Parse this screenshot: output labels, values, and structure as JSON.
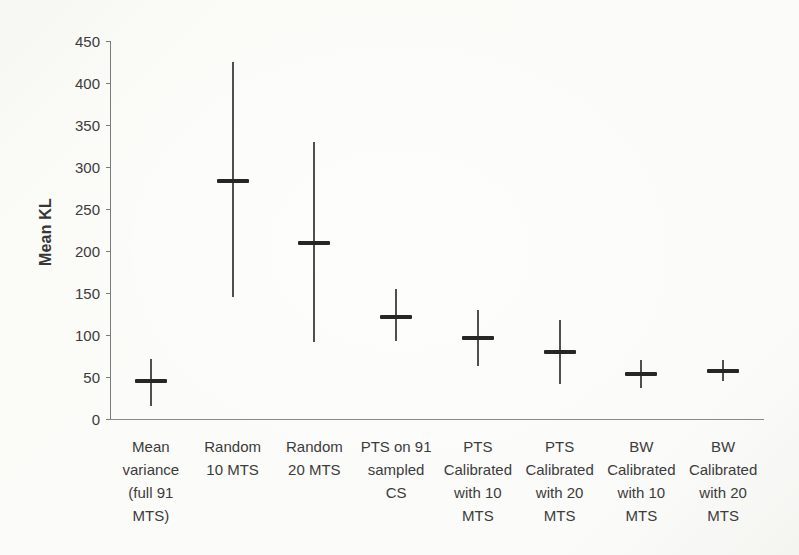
{
  "page": {
    "background": "#fafaf7"
  },
  "chart_data": {
    "type": "scatter",
    "subtype": "mean-with-error-bars",
    "title": "",
    "xlabel": "",
    "ylabel": "Mean KL",
    "ylim": [
      0,
      450
    ],
    "ytick_step": 50,
    "yticks": [
      450,
      400,
      350,
      300,
      250,
      200,
      150,
      100,
      50,
      0
    ],
    "grid": "off",
    "legend": "none",
    "categories": [
      "Mean variance (full 91 MTS)",
      "Random 10 MTS",
      "Random 20 MTS",
      "PTS on 91 sampled CS",
      "PTS Calibrated with 10 MTS",
      "PTS Calibrated with 20 MTS",
      "BW Calibrated with 10 MTS",
      "BW Calibrated with 20 MTS"
    ],
    "category_label_lines": [
      [
        "Mean",
        "variance",
        "(full 91",
        "MTS)"
      ],
      [
        "Random",
        "10 MTS"
      ],
      [
        "Random",
        "20 MTS"
      ],
      [
        "PTS on 91",
        "sampled",
        "CS"
      ],
      [
        "PTS",
        "Calibrated",
        "with 10",
        "MTS"
      ],
      [
        "PTS",
        "Calibrated",
        "with 20",
        "MTS"
      ],
      [
        "BW",
        "Calibrated",
        "with 10",
        "MTS"
      ],
      [
        "BW",
        "Calibrated",
        "with 20",
        "MTS"
      ]
    ],
    "series": [
      {
        "name": "Mean KL",
        "points": [
          {
            "mean": 45,
            "lo": 15,
            "hi": 72
          },
          {
            "mean": 283,
            "lo": 145,
            "hi": 425
          },
          {
            "mean": 210,
            "lo": 92,
            "hi": 330
          },
          {
            "mean": 122,
            "lo": 93,
            "hi": 155
          },
          {
            "mean": 97,
            "lo": 63,
            "hi": 130
          },
          {
            "mean": 80,
            "lo": 42,
            "hi": 118
          },
          {
            "mean": 54,
            "lo": 37,
            "hi": 70
          },
          {
            "mean": 57,
            "lo": 45,
            "hi": 70
          }
        ]
      }
    ],
    "colors": {
      "axis": "#7a7a78",
      "text": "#3c3c3c",
      "errorbar": "#4f4f4d",
      "mean_marker": "#262626"
    }
  }
}
